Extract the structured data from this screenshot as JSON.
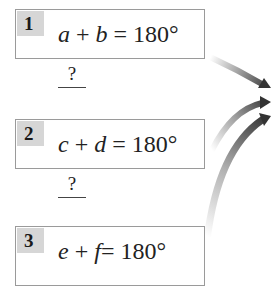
{
  "steps": [
    {
      "number": "1",
      "var1": "a",
      "op": "+",
      "var2": "b",
      "eq": "=",
      "value": "180°"
    },
    {
      "number": "2",
      "var1": "c",
      "op": "+",
      "var2": "d",
      "eq": "=",
      "value": "180°"
    },
    {
      "number": "3",
      "var1": "e",
      "op": "+",
      "var2": "f",
      "eq": "=",
      "value": "180°"
    }
  ],
  "reasons": [
    {
      "text": "?"
    },
    {
      "text": "?"
    }
  ],
  "colors": {
    "badge_bg": "#d6d6d6",
    "box_border": "#9a9a9a",
    "arrow_dark": "#3a3a3a",
    "arrow_light": "#e8e8e8"
  }
}
